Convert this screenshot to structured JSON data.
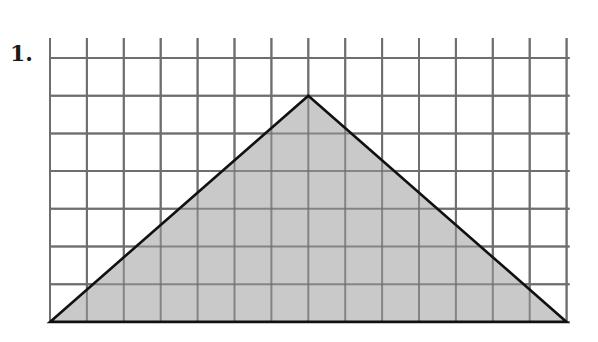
{
  "problem": {
    "number_label": "1."
  },
  "diagram": {
    "type": "grid-triangle",
    "grid": {
      "columns": 14,
      "rows": 7,
      "origin_px": [
        50,
        58
      ],
      "cell_w_px": 36.9,
      "cell_h_px": 37.7,
      "line_color": "#6e6e6e",
      "extend_top_px": 20,
      "extend_right_px": 3
    },
    "triangle": {
      "vertices_grid": [
        [
          0,
          7
        ],
        [
          7,
          1
        ],
        [
          14,
          7
        ]
      ],
      "fill": "#c9c9c9",
      "stroke": "#111111",
      "base_units": 14,
      "height_units": 6
    }
  }
}
